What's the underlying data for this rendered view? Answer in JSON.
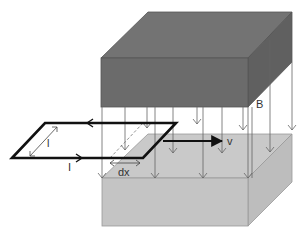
{
  "diagram": {
    "labels": {
      "field": "B",
      "velocity": "v",
      "length": "l",
      "current": "I",
      "displacement": "dx"
    },
    "colors": {
      "top_magnet_front": "#6b6b6b",
      "top_magnet_top": "#727272",
      "top_magnet_side": "#5e5e5e",
      "bottom_magnet_front": "#c4c4c4",
      "bottom_magnet_top": "#c9c9c9",
      "bottom_magnet_side": "#bdbdbd",
      "loop": "#111111",
      "field_lines": "#555555"
    }
  }
}
